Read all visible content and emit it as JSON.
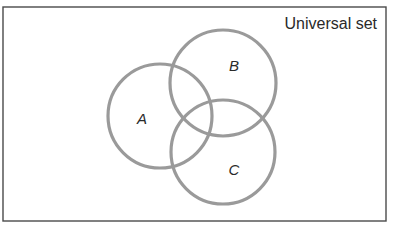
{
  "diagram": {
    "type": "venn",
    "universe": {
      "label": "Universal set",
      "border_color": "#4a4a4a"
    },
    "sets": [
      {
        "id": "A",
        "label": "A",
        "cx": 160,
        "cy": 116,
        "r": 52
      },
      {
        "id": "B",
        "label": "B",
        "cx": 223,
        "cy": 83,
        "r": 53
      },
      {
        "id": "C",
        "label": "C",
        "cx": 223,
        "cy": 152,
        "r": 52
      }
    ],
    "circle_color": "#9a9a9a"
  }
}
